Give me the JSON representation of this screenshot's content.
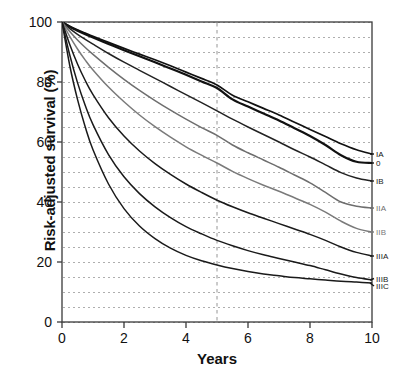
{
  "chart_data": {
    "type": "line",
    "title": "",
    "xlabel": "Years",
    "ylabel": "Risk-adjusted survival (%)",
    "xlim": [
      0,
      10
    ],
    "ylim": [
      0,
      100
    ],
    "xticks": [
      0,
      2,
      4,
      6,
      8,
      10
    ],
    "yticks": [
      0,
      20,
      40,
      60,
      80,
      100
    ],
    "grid": "horizontal dotted minor every 5%, vertical dashed reference line at year 5",
    "legend_position": "right, at curve ends",
    "reference_line_x": 5,
    "x": [
      0,
      0.25,
      0.5,
      0.75,
      1,
      1.5,
      2,
      2.5,
      3,
      3.5,
      4,
      4.5,
      5,
      5.5,
      6,
      6.5,
      7,
      7.5,
      8,
      8.5,
      9,
      9.5,
      10
    ],
    "series": [
      {
        "name": "IA",
        "label": "IA",
        "color": "#111111",
        "width": 1.7,
        "values": [
          100,
          98.6,
          97.4,
          96.3,
          95.2,
          93.2,
          91.2,
          89.3,
          87.4,
          85.4,
          83.3,
          81.2,
          79.0,
          75.6,
          73.4,
          71.2,
          69.0,
          66.6,
          64.2,
          61.8,
          59.4,
          57.4,
          56.0
        ]
      },
      {
        "name": "0",
        "label": "0",
        "color": "#111111",
        "width": 2.2,
        "values": [
          100,
          98.4,
          97.1,
          95.9,
          94.8,
          92.7,
          90.6,
          88.6,
          86.6,
          84.5,
          82.4,
          80.2,
          78.0,
          74.2,
          71.8,
          69.5,
          67.2,
          64.6,
          62.0,
          59.0,
          55.6,
          53.4,
          53.0
        ]
      },
      {
        "name": "IB",
        "label": "IB",
        "color": "#222222",
        "width": 1.5,
        "values": [
          100,
          97.8,
          95.9,
          94.2,
          92.6,
          89.5,
          86.6,
          83.9,
          81.2,
          78.5,
          75.8,
          73.1,
          70.4,
          67.6,
          65.0,
          62.5,
          60.0,
          57.4,
          55.0,
          52.4,
          49.8,
          48.0,
          47.0
        ]
      },
      {
        "name": "IIA",
        "label": "IIA",
        "color": "#6e6e6e",
        "width": 1.5,
        "values": [
          100,
          96.8,
          94.0,
          91.5,
          89.2,
          84.9,
          80.9,
          77.2,
          73.8,
          70.6,
          67.6,
          64.8,
          62.2,
          59.0,
          56.4,
          54.0,
          51.6,
          49.0,
          46.4,
          43.2,
          40.0,
          38.6,
          38.0
        ]
      },
      {
        "name": "IIB",
        "label": "IIB",
        "color": "#7a7a7a",
        "width": 1.5,
        "values": [
          100,
          95.2,
          91.0,
          87.3,
          84.0,
          78.3,
          73.4,
          69.0,
          65.1,
          61.6,
          58.4,
          55.6,
          53.0,
          50.2,
          47.8,
          45.6,
          43.6,
          41.4,
          39.2,
          36.6,
          33.6,
          31.2,
          30.0
        ]
      },
      {
        "name": "IIIA",
        "label": "IIIA",
        "color": "#1a1a1a",
        "width": 1.5,
        "values": [
          100,
          92.5,
          86.0,
          80.5,
          75.8,
          68.1,
          62.0,
          57.0,
          52.8,
          49.2,
          46.0,
          43.2,
          40.6,
          38.4,
          36.4,
          34.6,
          32.8,
          31.0,
          29.2,
          27.2,
          25.0,
          23.2,
          22.0
        ]
      },
      {
        "name": "IIIB",
        "label": "IIIB",
        "color": "#1a1a1a",
        "width": 1.5,
        "values": [
          100,
          89.0,
          79.8,
          72.2,
          65.8,
          55.8,
          48.4,
          42.8,
          38.4,
          34.8,
          31.8,
          29.4,
          27.2,
          25.4,
          23.8,
          22.4,
          21.2,
          20.0,
          18.8,
          17.4,
          16.0,
          14.8,
          14.0
        ]
      },
      {
        "name": "IIIC",
        "label": "IIIC",
        "color": "#1a1a1a",
        "width": 1.5,
        "values": [
          100,
          85.5,
          74.2,
          65.0,
          57.4,
          46.0,
          37.8,
          32.0,
          27.8,
          24.6,
          22.2,
          20.4,
          19.0,
          17.8,
          16.8,
          16.0,
          15.4,
          14.8,
          14.4,
          14.0,
          13.6,
          13.3,
          13.0
        ]
      }
    ],
    "legend_anchor_y": {
      "IA": 56.0,
      "0": 53.0,
      "IB": 47.0,
      "IIA": 38.0,
      "IIB": 30.0,
      "IIIA": 22.0,
      "IIIB": 14.5,
      "IIIC": 12.0
    }
  },
  "axes": {
    "frame_color": "#3a3a3a",
    "gridline_color": "#9a9a9a",
    "reference_line_color": "#8a8a8a"
  }
}
